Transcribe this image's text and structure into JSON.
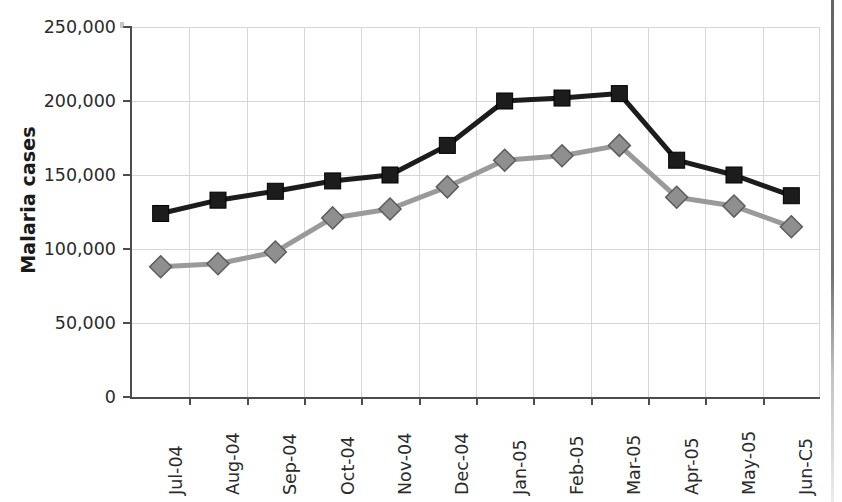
{
  "chart_data": {
    "type": "line",
    "title": "",
    "xlabel": "",
    "ylabel": "Malaria cases",
    "ylim": [
      0,
      250000
    ],
    "yticks": [
      0,
      50000,
      100000,
      150000,
      200000,
      250000
    ],
    "ytick_labels": [
      "0",
      "50,000",
      "100,000",
      "150,000",
      "200,000",
      "250,000"
    ],
    "grid": true,
    "legend": "none",
    "categories": [
      "Jul-04",
      "Aug-04",
      "Sep-04",
      "Oct-04",
      "Nov-04",
      "Dec-04",
      "Jan-05",
      "Feb-05",
      "Mar-05",
      "Apr-05",
      "May-05",
      "Jun-C5"
    ],
    "series": [
      {
        "name": "series-1-dark-squares",
        "marker": "square",
        "color": "#1c1c1c",
        "values": [
          124000,
          133000,
          139000,
          146000,
          150000,
          170000,
          200000,
          202000,
          205000,
          160000,
          150000,
          136000
        ]
      },
      {
        "name": "series-2-gray-diamonds",
        "marker": "diamond",
        "color": "#9a9a9a",
        "values": [
          88000,
          90000,
          98000,
          121000,
          127000,
          142000,
          160000,
          163000,
          170000,
          135000,
          129000,
          115000
        ]
      }
    ]
  },
  "colors": {
    "axis": "#4d4d4d",
    "grid": "#d6d6d6",
    "series_dark": "#1c1c1c",
    "series_gray": "#9a9a9a",
    "marker_gray_fill": "#8f8f8f",
    "marker_gray_stroke": "#5c5c5c",
    "text": "#2b2b2b",
    "background": "#ffffff"
  }
}
